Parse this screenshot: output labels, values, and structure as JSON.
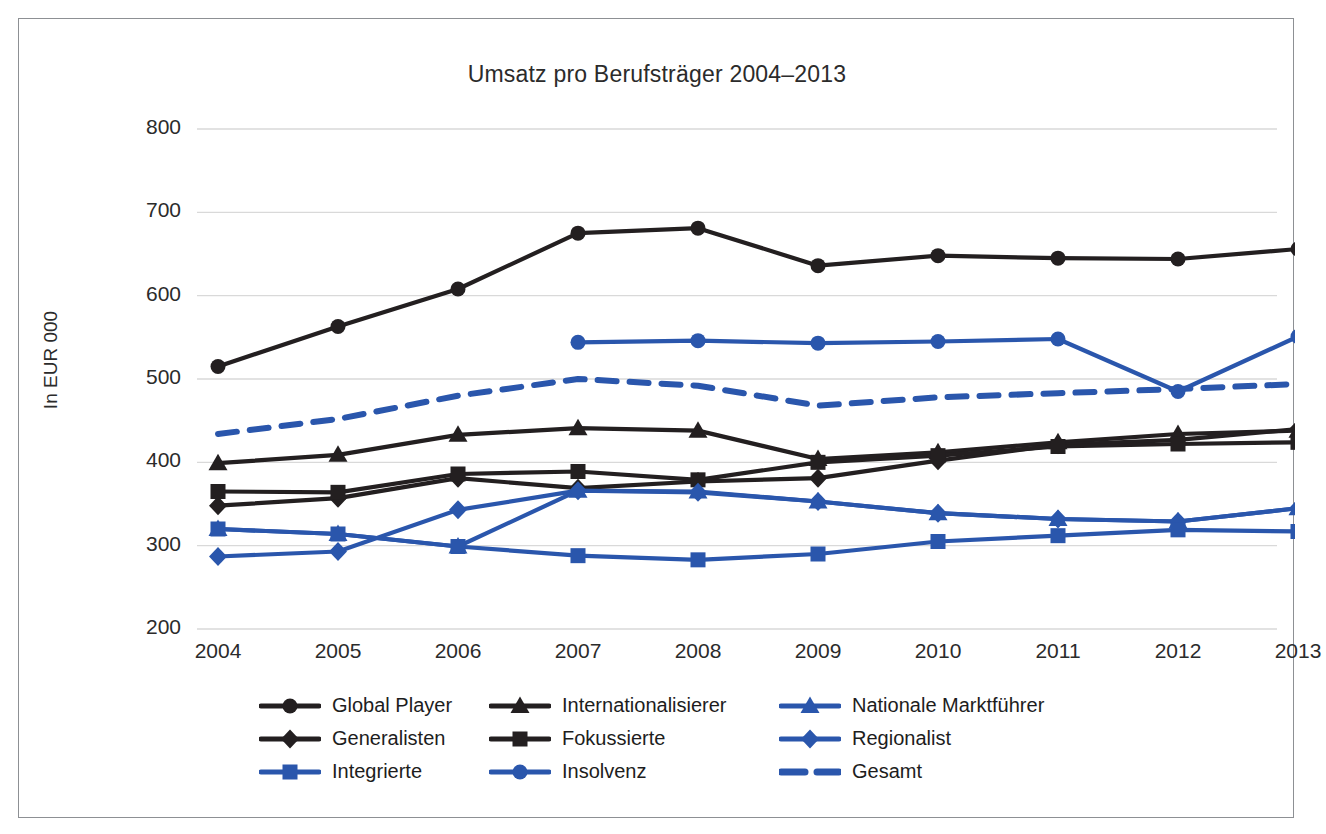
{
  "chart_data": {
    "type": "line",
    "title": "Umsatz pro Berufsträger 2004–2013",
    "xlabel": "",
    "ylabel": "In EUR 000",
    "categories": [
      "2004",
      "2005",
      "2006",
      "2007",
      "2008",
      "2009",
      "2010",
      "2011",
      "2012",
      "2013"
    ],
    "ylim": [
      200,
      800
    ],
    "yticks": [
      "200",
      "300",
      "400",
      "500",
      "600",
      "700",
      "800"
    ],
    "grid": true,
    "legend_position": "bottom",
    "series": [
      {
        "name": "Global Player",
        "marker": "circle",
        "color": "#231f20",
        "dashed": false,
        "values": [
          515,
          563,
          608,
          675,
          681,
          636,
          648,
          645,
          644,
          656
        ]
      },
      {
        "name": "Internationalisierer",
        "marker": "triangle",
        "color": "#231f20",
        "dashed": false,
        "values": [
          399,
          409,
          433,
          441,
          438,
          404,
          412,
          424,
          434,
          438
        ]
      },
      {
        "name": "Nationale Marktführer",
        "marker": "triangle",
        "color": "#2a56ac",
        "dashed": false,
        "values": [
          320,
          314,
          299,
          366,
          365,
          353,
          339,
          332,
          329,
          345
        ]
      },
      {
        "name": "Generalisten",
        "marker": "diamond",
        "color": "#231f20",
        "dashed": false,
        "values": [
          348,
          357,
          381,
          369,
          377,
          381,
          402,
          421,
          427,
          440
        ]
      },
      {
        "name": "Fokussierte",
        "marker": "square",
        "color": "#231f20",
        "dashed": false,
        "values": [
          365,
          364,
          386,
          389,
          379,
          400,
          408,
          419,
          422,
          424
        ]
      },
      {
        "name": "Regionalist",
        "marker": "diamond",
        "color": "#2a56ac",
        "dashed": false,
        "values": [
          287,
          293,
          343,
          366,
          364,
          353,
          339,
          332,
          329,
          345
        ]
      },
      {
        "name": "Integrierte",
        "marker": "square",
        "color": "#2a56ac",
        "dashed": false,
        "values": [
          320,
          314,
          299,
          288,
          283,
          290,
          305,
          312,
          319,
          317
        ]
      },
      {
        "name": "Insolvenz",
        "marker": "circle",
        "color": "#2a56ac",
        "dashed": false,
        "values": [
          null,
          null,
          null,
          544,
          546,
          543,
          545,
          548,
          485,
          551
        ]
      },
      {
        "name": "Gesamt",
        "marker": "none",
        "color": "#2a56ac",
        "dashed": true,
        "values": [
          434,
          452,
          480,
          500,
          492,
          468,
          478,
          483,
          488,
          494
        ]
      }
    ]
  },
  "legend": {
    "rows": [
      [
        {
          "label": "Global Player"
        },
        {
          "label": "Internationalisierer"
        },
        {
          "label": "Nationale Marktführer"
        }
      ],
      [
        {
          "label": "Generalisten"
        },
        {
          "label": "Fokussierte"
        },
        {
          "label": "Regionalist"
        }
      ],
      [
        {
          "label": "Integrierte"
        },
        {
          "label": "Insolvenz"
        },
        {
          "label": "Gesamt"
        }
      ]
    ]
  },
  "colors": {
    "black": "#231f20",
    "blue": "#2a56ac",
    "grid": "#d9d9d9",
    "border": "#8d9094",
    "text": "#2b2b2b"
  }
}
